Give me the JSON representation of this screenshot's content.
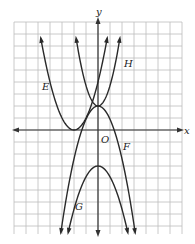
{
  "figure": {
    "axis_labels": {
      "x": "x",
      "y": "y",
      "origin": "O"
    },
    "curve_labels": {
      "E": "E",
      "F": "F",
      "G": "G",
      "H": "H"
    },
    "colors": {
      "grid": "#bdbdbd",
      "axis": "#333333",
      "curve": "#2a2a2a",
      "background": "#ffffff"
    },
    "grid": {
      "x_min": -7,
      "x_max": 7,
      "y_min": -9,
      "y_max": 9,
      "cell_px": 12
    }
  },
  "chart_data": {
    "type": "line",
    "title": "",
    "xlabel": "x",
    "ylabel": "y",
    "grid": true,
    "series": [
      {
        "name": "E",
        "shape": "parabola opening up",
        "vertex": [
          -2,
          0
        ]
      },
      {
        "name": "H",
        "shape": "parabola opening up",
        "vertex": [
          0,
          2
        ]
      },
      {
        "name": "F",
        "shape": "parabola opening down",
        "vertex": [
          0,
          2
        ]
      },
      {
        "name": "G",
        "shape": "parabola opening down",
        "vertex": [
          0,
          -3
        ]
      }
    ]
  }
}
